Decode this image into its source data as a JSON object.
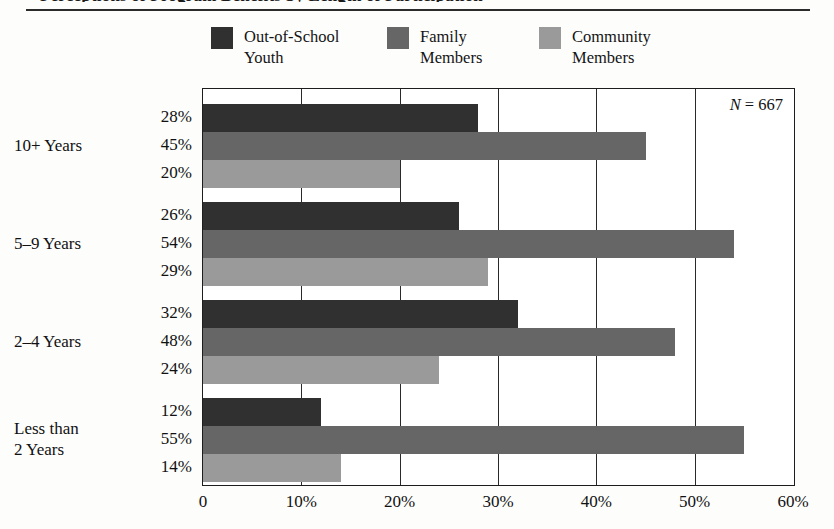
{
  "figure": {
    "title_cropped": "Perceptions of Program Benefits by Length of Participation",
    "n_annotation_prefix": "N",
    "n_annotation_value": "= 667"
  },
  "legend": {
    "items": [
      {
        "label": "Out-of-School\nYouth",
        "color": "#303030",
        "swatch_name": "legend-swatch-out-of-school-youth"
      },
      {
        "label": "Family\nMembers",
        "color": "#666666",
        "swatch_name": "legend-swatch-family-members"
      },
      {
        "label": "Community\nMembers",
        "color": "#9a9a9a",
        "swatch_name": "legend-swatch-community-members"
      }
    ]
  },
  "axis": {
    "ticks": [
      "0",
      "10%",
      "20%",
      "30%",
      "40%",
      "50%",
      "60%"
    ],
    "tick_values": [
      0,
      10,
      20,
      30,
      40,
      50,
      60
    ]
  },
  "chart_data": {
    "type": "bar",
    "orientation": "horizontal",
    "title": "Perceptions of Program Benefits by Length of Participation",
    "xlabel": "",
    "ylabel": "",
    "xlim": [
      0,
      60
    ],
    "xticks": [
      0,
      10,
      20,
      30,
      40,
      50,
      60
    ],
    "xticklabels": [
      "0",
      "10%",
      "20%",
      "30%",
      "40%",
      "50%",
      "60%"
    ],
    "grid": true,
    "legend_position": "top",
    "annotation": "N = 667",
    "categories": [
      "10+ Years",
      "5–9 Years",
      "2–4 Years",
      "Less than\n2 Years"
    ],
    "series": [
      {
        "name": "Out-of-School Youth",
        "color": "#303030",
        "values": [
          28,
          26,
          32,
          12
        ],
        "labels": [
          "28%",
          "26%",
          "32%",
          "12%"
        ]
      },
      {
        "name": "Family Members",
        "color": "#666666",
        "values": [
          45,
          54,
          48,
          55
        ],
        "labels": [
          "45%",
          "54%",
          "48%",
          "55%"
        ]
      },
      {
        "name": "Community Members",
        "color": "#9a9a9a",
        "values": [
          20,
          29,
          24,
          14
        ],
        "labels": [
          "20%",
          "29%",
          "24%",
          "14%"
        ]
      }
    ]
  }
}
